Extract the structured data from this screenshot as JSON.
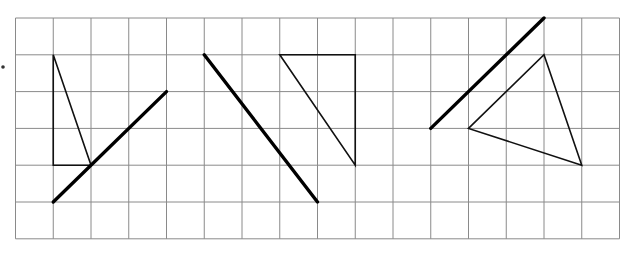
{
  "diagram": {
    "type": "grid-reflection-exercise",
    "grid": {
      "origin": [
        15.5,
        18
      ],
      "cell": 37.75,
      "cell_h": 36.8,
      "cols": 16,
      "rows": 6,
      "line_color": "#8a8a8a",
      "line_width": 1
    },
    "marker_dot": {
      "x": 3,
      "y": 67,
      "r": 1.8
    },
    "figures": [
      {
        "id": "figure-1",
        "triangle": [
          [
            1,
            1
          ],
          [
            1,
            4
          ],
          [
            2,
            4
          ]
        ],
        "mirror_line": [
          [
            1,
            5
          ],
          [
            4,
            2
          ]
        ]
      },
      {
        "id": "figure-2",
        "triangle": [
          [
            7,
            1
          ],
          [
            9,
            1
          ],
          [
            9,
            4
          ]
        ],
        "mirror_line": [
          [
            5,
            1
          ],
          [
            8,
            5
          ]
        ]
      },
      {
        "id": "figure-3",
        "triangle": [
          [
            12,
            3
          ],
          [
            14,
            1
          ],
          [
            15,
            4
          ]
        ],
        "mirror_line": [
          [
            11,
            3
          ],
          [
            14,
            0
          ]
        ]
      }
    ],
    "colors": {
      "shape_stroke": "#111111",
      "mirror_stroke": "#000000"
    }
  }
}
